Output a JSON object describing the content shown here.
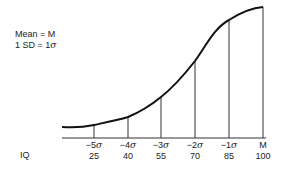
{
  "legend": {
    "line1": "Mean = M",
    "line2_prefix": "1 SD = 1",
    "line2_symbol": "σ"
  },
  "axis": {
    "row_label": "IQ",
    "ticks": [
      {
        "sd_prefix": "−5",
        "sd_symbol": "σ",
        "iq": "25"
      },
      {
        "sd_prefix": "−4",
        "sd_symbol": "σ",
        "iq": "40"
      },
      {
        "sd_prefix": "−3",
        "sd_symbol": "σ",
        "iq": "55"
      },
      {
        "sd_prefix": "−2",
        "sd_symbol": "σ",
        "iq": "70"
      },
      {
        "sd_prefix": "−1",
        "sd_symbol": "σ",
        "iq": "85"
      },
      {
        "sd_prefix": "M",
        "sd_symbol": "",
        "iq": "100"
      }
    ]
  },
  "colors": {
    "line": "#111111",
    "grid": "#333333"
  }
}
